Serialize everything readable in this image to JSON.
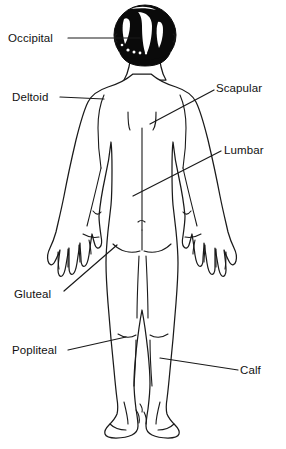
{
  "figure": {
    "view": "posterior",
    "background_color": "#ffffff",
    "line_color": "#1a1a1a",
    "hair_color": "#0a0a0a",
    "text_color": "#111111"
  },
  "labels": [
    {
      "id": "occipital",
      "text": "Occipital",
      "side": "left",
      "x": 8,
      "y": 32,
      "leader": {
        "x1": 68,
        "y1": 38,
        "x2": 140,
        "y2": 38
      }
    },
    {
      "id": "deltoid",
      "text": "Deltoid",
      "side": "left",
      "x": 12,
      "y": 91,
      "leader": {
        "x1": 60,
        "y1": 97,
        "x2": 104,
        "y2": 99
      }
    },
    {
      "id": "scapular",
      "text": "Scapular",
      "side": "right",
      "x": 216,
      "y": 82,
      "leader": {
        "x1": 214,
        "y1": 90,
        "x2": 150,
        "y2": 124
      }
    },
    {
      "id": "lumbar",
      "text": "Lumbar",
      "side": "right",
      "x": 224,
      "y": 144,
      "leader": {
        "x1": 221,
        "y1": 151,
        "x2": 133,
        "y2": 196
      }
    },
    {
      "id": "gluteal",
      "text": "Gluteal",
      "side": "left",
      "x": 14,
      "y": 288,
      "leader": {
        "x1": 64,
        "y1": 291,
        "x2": 117,
        "y2": 245
      }
    },
    {
      "id": "popliteal",
      "text": "Popliteal",
      "side": "left",
      "x": 12,
      "y": 344,
      "leader": {
        "x1": 68,
        "y1": 350,
        "x2": 126,
        "y2": 337
      }
    },
    {
      "id": "calf",
      "text": "Calf",
      "side": "right",
      "x": 240,
      "y": 364,
      "leader": {
        "x1": 238,
        "y1": 370,
        "x2": 160,
        "y2": 358
      }
    }
  ],
  "regions": [
    {
      "id": "occipital",
      "name": "Occipital",
      "body_part": "back of head"
    },
    {
      "id": "deltoid",
      "name": "Deltoid",
      "body_part": "shoulder"
    },
    {
      "id": "scapular",
      "name": "Scapular",
      "body_part": "upper back / shoulder blade"
    },
    {
      "id": "lumbar",
      "name": "Lumbar",
      "body_part": "lower back"
    },
    {
      "id": "gluteal",
      "name": "Gluteal",
      "body_part": "buttock"
    },
    {
      "id": "popliteal",
      "name": "Popliteal",
      "body_part": "back of knee"
    },
    {
      "id": "calf",
      "name": "Calf",
      "body_part": "posterior lower leg"
    }
  ]
}
